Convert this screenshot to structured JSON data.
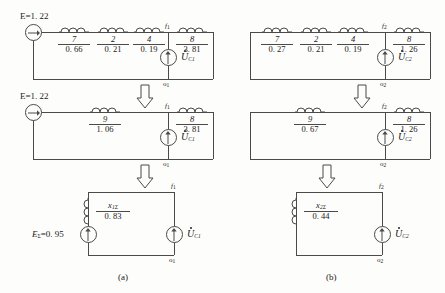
{
  "figure": {
    "caption_a": "(a)",
    "caption_b": "(b)"
  },
  "icons": {
    "source_arrow_right": "current-source-arrow-right",
    "source_arrow_up": "current-source-arrow-up",
    "transition_arrow": "down-arrow-block"
  },
  "circuits": {
    "top_left": {
      "source_label": "E=1. 22",
      "branches": [
        {
          "num": "7",
          "den": "0. 66"
        },
        {
          "num": "2",
          "den": "0. 21"
        },
        {
          "num": "4",
          "den": "0. 19"
        },
        {
          "num": "8",
          "den": "3. 81"
        }
      ],
      "node_top": "f",
      "node_top_sub": "1",
      "node_bottom": "o",
      "node_bottom_sub": "1",
      "voltage_label": "U",
      "voltage_sub": "C1"
    },
    "top_right": {
      "source_label": "",
      "branches": [
        {
          "num": "7",
          "den": "0. 27"
        },
        {
          "num": "2",
          "den": "0. 21"
        },
        {
          "num": "4",
          "den": "0. 19"
        },
        {
          "num": "8",
          "den": "1. 26"
        }
      ],
      "node_top": "f",
      "node_top_sub": "2",
      "node_bottom": "o",
      "node_bottom_sub": "2",
      "voltage_label": "U",
      "voltage_sub": "C2"
    },
    "mid_left": {
      "source_label": "E=1. 22",
      "branches": [
        {
          "num": "9",
          "den": "1. 06"
        },
        {
          "num": "8",
          "den": "3. 81"
        }
      ],
      "node_top": "f",
      "node_top_sub": "1",
      "node_bottom": "o",
      "node_bottom_sub": "1",
      "voltage_label": "U",
      "voltage_sub": "C1"
    },
    "mid_right": {
      "source_label": "",
      "branches": [
        {
          "num": "9",
          "den": "0. 67"
        },
        {
          "num": "8",
          "den": "1. 26"
        }
      ],
      "node_top": "f",
      "node_top_sub": "2",
      "node_bottom": "o",
      "node_bottom_sub": "2",
      "voltage_label": "U",
      "voltage_sub": "C2"
    },
    "bot_left": {
      "source_label": "E",
      "source_sub": "Σ",
      "source_value": "=0. 95",
      "reactance_num": "x",
      "reactance_num_sub": "1Σ",
      "reactance_den": "0. 83",
      "node_top": "f",
      "node_top_sub": "1",
      "node_bottom": "o",
      "node_bottom_sub": "1",
      "voltage_label": "U",
      "voltage_sub": "C1"
    },
    "bot_right": {
      "source_label": "",
      "reactance_num": "x",
      "reactance_num_sub": "2Σ",
      "reactance_den": "0. 44",
      "node_top": "f",
      "node_top_sub": "2",
      "node_bottom": "o",
      "node_bottom_sub": "2",
      "voltage_label": "U",
      "voltage_sub": "C2"
    }
  },
  "colors": {
    "ink": "#4a4a4a",
    "text": "#1a1a1a",
    "paper": "#fdfdfb"
  }
}
